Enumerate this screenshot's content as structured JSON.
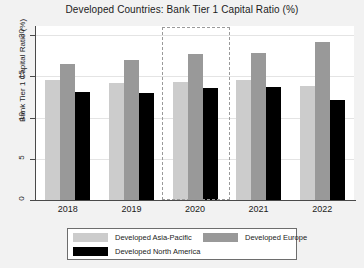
{
  "chart_data": {
    "type": "bar",
    "title": "Developed Countries: Bank Tier 1 Capital Ratio (%)",
    "xlabel": "",
    "ylabel": "Bank Tier 1 Capital Ratio (%)",
    "categories": [
      "2018",
      "2019",
      "2020",
      "2021",
      "2022"
    ],
    "ylim": [
      0,
      21
    ],
    "yticks": [
      "0",
      "5",
      "10",
      "15",
      "20"
    ],
    "ytick_values": [
      0,
      5,
      10,
      15,
      20
    ],
    "grid": true,
    "legend_position": "below-center",
    "series": [
      {
        "name": "Developed Asia-Pacific",
        "color": "#cccccc",
        "values": [
          14.6,
          14.2,
          14.3,
          14.6,
          13.8
        ]
      },
      {
        "name": "Developed Europe",
        "color": "#999999",
        "values": [
          16.5,
          17.0,
          17.7,
          17.8,
          19.2
        ]
      },
      {
        "name": "Developed North America",
        "color": "#000000",
        "values": [
          13.1,
          13.0,
          13.6,
          13.7,
          12.1
        ]
      }
    ],
    "annotations": [
      {
        "name": "highlight-box",
        "type": "dashed-rectangle",
        "covers_category": "2020",
        "color": "#9a9a9a"
      }
    ]
  }
}
